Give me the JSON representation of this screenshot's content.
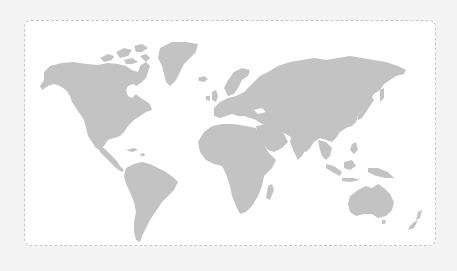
{
  "map": {
    "type": "world-map",
    "colors": {
      "page_background": "#f4f4f4",
      "frame_background": "#ffffff",
      "frame_border": "#c6c6c6",
      "land": "#c3c3c3"
    },
    "regions": [
      "north-america",
      "greenland",
      "arctic-islands",
      "central-america",
      "caribbean",
      "south-america",
      "europe",
      "uk-ireland",
      "iceland",
      "africa",
      "madagascar",
      "middle-east",
      "asia",
      "japan",
      "southeast-asia",
      "indonesia",
      "new-guinea",
      "australia",
      "tasmania",
      "new-zealand"
    ]
  }
}
